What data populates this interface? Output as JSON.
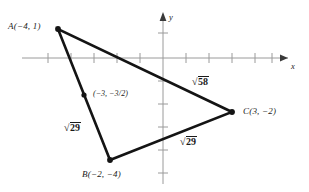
{
  "figure": {
    "type": "coordinate-geometry-diagram"
  },
  "axes": {
    "x_label": "x",
    "y_label": "y",
    "origin_px": [
      163,
      58
    ],
    "unit_px": 23,
    "x_tick_count": 10,
    "y_tick_count": 6,
    "grid": false,
    "arrowheads": [
      "x-positive",
      "y-positive"
    ]
  },
  "vertices": [
    {
      "name": "A",
      "label": "A(−4, 1)",
      "x": -4,
      "y": 1,
      "px": [
        58,
        29
      ],
      "label_px": [
        8,
        22
      ],
      "label_anchor": "left"
    },
    {
      "name": "B",
      "label": "B(−2, −4)",
      "x": -2,
      "y": -4,
      "px": [
        110,
        160
      ],
      "label_px": [
        82,
        170
      ],
      "label_anchor": "left"
    },
    {
      "name": "C",
      "label": "C(3, −2)",
      "x": 3,
      "y": -2,
      "px": [
        232,
        112
      ],
      "label_px": [
        243,
        107
      ],
      "label_anchor": "left"
    }
  ],
  "midpoint": {
    "name": "midpoint-AB",
    "x": -3,
    "y": -1.5,
    "px": [
      84,
      95
    ],
    "label_px": [
      93,
      90
    ],
    "label_prefix": "(−3, −",
    "label_fraction_num": "3",
    "label_fraction_slash": "/",
    "label_fraction_den": "2",
    "label_suffix": ")",
    "label_plain": "(−3, −3/2)"
  },
  "sides": [
    {
      "name": "side-AB",
      "from": "A",
      "to": "B",
      "length_label": "29",
      "radical": "√",
      "label_px": [
        64,
        122
      ]
    },
    {
      "name": "side-BC",
      "from": "B",
      "to": "C",
      "length_label": "29",
      "radical": "√",
      "label_px": [
        180,
        136
      ]
    },
    {
      "name": "side-AC",
      "from": "A",
      "to": "C",
      "length_label": "58",
      "radical": "√",
      "label_px": [
        192,
        76
      ]
    }
  ],
  "colors": {
    "triangle_stroke": "#141414",
    "axis_stroke": "#9a9a9a",
    "text": "#1a1a1a",
    "background": "#ffffff"
  }
}
